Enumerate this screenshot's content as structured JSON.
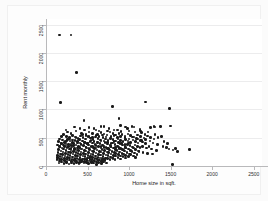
{
  "figure": {
    "background_color": "#fbfbfb",
    "plot_background_color": "#ffffff",
    "marker_color": "#1a1a1a",
    "gridline_color": "#ececed",
    "axis_color": "#b9b9bb"
  },
  "chart_data": {
    "type": "scatter",
    "title": "",
    "xlabel": "Home size in sqft.",
    "ylabel": "Rent monthly",
    "xlim": [
      0,
      2600
    ],
    "ylim": [
      0,
      2600
    ],
    "xticks": [
      0,
      500,
      1000,
      1500,
      2000,
      2500
    ],
    "xticklabels": [
      "0",
      "500",
      "1000",
      "1500",
      "2000",
      "2500"
    ],
    "yticks": [
      0,
      500,
      1000,
      1500,
      2000,
      2500
    ],
    "yticklabels": [
      "0",
      "500",
      "1000",
      "1500",
      "2000",
      "2500"
    ],
    "grid": "horizontal",
    "legend": null,
    "n_points": 402,
    "points": [
      [
        160,
        2320
      ],
      [
        300,
        2320
      ],
      [
        370,
        1650
      ],
      [
        175,
        1120
      ],
      [
        800,
        1050
      ],
      [
        1200,
        1130
      ],
      [
        1490,
        1020
      ],
      [
        1520,
        30
      ],
      [
        455,
        800
      ],
      [
        880,
        845
      ],
      [
        1380,
        700
      ],
      [
        1500,
        705
      ],
      [
        700,
        700
      ],
      [
        760,
        660
      ],
      [
        960,
        690
      ],
      [
        1035,
        700
      ],
      [
        1130,
        650
      ],
      [
        1255,
        680
      ],
      [
        1300,
        700
      ],
      [
        1310,
        690
      ],
      [
        600,
        640
      ],
      [
        640,
        620
      ],
      [
        860,
        640
      ],
      [
        905,
        610
      ],
      [
        1000,
        620
      ],
      [
        1070,
        600
      ],
      [
        1150,
        590
      ],
      [
        1190,
        560
      ],
      [
        430,
        580
      ],
      [
        480,
        560
      ],
      [
        520,
        600
      ],
      [
        560,
        575
      ],
      [
        620,
        555
      ],
      [
        660,
        590
      ],
      [
        700,
        565
      ],
      [
        735,
        545
      ],
      [
        770,
        600
      ],
      [
        805,
        570
      ],
      [
        840,
        545
      ],
      [
        880,
        580
      ],
      [
        915,
        555
      ],
      [
        950,
        530
      ],
      [
        985,
        565
      ],
      [
        1020,
        540
      ],
      [
        1060,
        510
      ],
      [
        1100,
        545
      ],
      [
        1140,
        520
      ],
      [
        1180,
        495
      ],
      [
        1220,
        530
      ],
      [
        1260,
        505
      ],
      [
        1300,
        480
      ],
      [
        1350,
        500
      ],
      [
        1420,
        430
      ],
      [
        1460,
        400
      ],
      [
        1560,
        310
      ],
      [
        1730,
        290
      ],
      [
        250,
        520
      ],
      [
        285,
        500
      ],
      [
        320,
        540
      ],
      [
        350,
        515
      ],
      [
        385,
        490
      ],
      [
        415,
        530
      ],
      [
        445,
        505
      ],
      [
        475,
        480
      ],
      [
        505,
        520
      ],
      [
        535,
        495
      ],
      [
        565,
        470
      ],
      [
        595,
        510
      ],
      [
        625,
        485
      ],
      [
        655,
        460
      ],
      [
        685,
        500
      ],
      [
        715,
        475
      ],
      [
        745,
        450
      ],
      [
        775,
        490
      ],
      [
        805,
        465
      ],
      [
        835,
        440
      ],
      [
        865,
        480
      ],
      [
        895,
        455
      ],
      [
        925,
        430
      ],
      [
        955,
        470
      ],
      [
        985,
        445
      ],
      [
        1015,
        420
      ],
      [
        1045,
        460
      ],
      [
        1075,
        435
      ],
      [
        1105,
        410
      ],
      [
        1135,
        450
      ],
      [
        1165,
        425
      ],
      [
        1195,
        400
      ],
      [
        200,
        460
      ],
      [
        230,
        435
      ],
      [
        260,
        470
      ],
      [
        290,
        445
      ],
      [
        320,
        420
      ],
      [
        350,
        455
      ],
      [
        380,
        430
      ],
      [
        410,
        405
      ],
      [
        440,
        445
      ],
      [
        470,
        420
      ],
      [
        500,
        395
      ],
      [
        530,
        435
      ],
      [
        560,
        410
      ],
      [
        590,
        385
      ],
      [
        620,
        425
      ],
      [
        650,
        400
      ],
      [
        680,
        375
      ],
      [
        710,
        415
      ],
      [
        740,
        390
      ],
      [
        770,
        365
      ],
      [
        800,
        405
      ],
      [
        830,
        380
      ],
      [
        860,
        355
      ],
      [
        890,
        395
      ],
      [
        920,
        370
      ],
      [
        950,
        345
      ],
      [
        980,
        385
      ],
      [
        1010,
        360
      ],
      [
        1040,
        335
      ],
      [
        1070,
        375
      ],
      [
        1100,
        350
      ],
      [
        1130,
        325
      ],
      [
        180,
        400
      ],
      [
        210,
        375
      ],
      [
        240,
        410
      ],
      [
        270,
        385
      ],
      [
        300,
        360
      ],
      [
        330,
        395
      ],
      [
        360,
        370
      ],
      [
        390,
        345
      ],
      [
        420,
        385
      ],
      [
        450,
        360
      ],
      [
        480,
        335
      ],
      [
        510,
        375
      ],
      [
        540,
        350
      ],
      [
        570,
        325
      ],
      [
        600,
        365
      ],
      [
        630,
        340
      ],
      [
        660,
        315
      ],
      [
        690,
        355
      ],
      [
        720,
        330
      ],
      [
        750,
        305
      ],
      [
        780,
        345
      ],
      [
        810,
        320
      ],
      [
        840,
        295
      ],
      [
        870,
        335
      ],
      [
        900,
        310
      ],
      [
        930,
        285
      ],
      [
        960,
        325
      ],
      [
        990,
        300
      ],
      [
        1020,
        275
      ],
      [
        1050,
        315
      ],
      [
        1080,
        290
      ],
      [
        1110,
        265
      ],
      [
        165,
        340
      ],
      [
        195,
        315
      ],
      [
        225,
        350
      ],
      [
        255,
        325
      ],
      [
        285,
        300
      ],
      [
        315,
        335
      ],
      [
        345,
        310
      ],
      [
        375,
        285
      ],
      [
        405,
        325
      ],
      [
        435,
        300
      ],
      [
        465,
        275
      ],
      [
        495,
        315
      ],
      [
        525,
        290
      ],
      [
        555,
        265
      ],
      [
        585,
        305
      ],
      [
        615,
        280
      ],
      [
        645,
        255
      ],
      [
        675,
        295
      ],
      [
        705,
        270
      ],
      [
        735,
        245
      ],
      [
        765,
        285
      ],
      [
        795,
        260
      ],
      [
        825,
        235
      ],
      [
        855,
        275
      ],
      [
        885,
        250
      ],
      [
        915,
        225
      ],
      [
        945,
        265
      ],
      [
        975,
        240
      ],
      [
        1005,
        215
      ],
      [
        1035,
        255
      ],
      [
        1065,
        230
      ],
      [
        1095,
        205
      ],
      [
        150,
        290
      ],
      [
        180,
        265
      ],
      [
        210,
        300
      ],
      [
        240,
        275
      ],
      [
        270,
        250
      ],
      [
        300,
        285
      ],
      [
        330,
        260
      ],
      [
        360,
        235
      ],
      [
        390,
        275
      ],
      [
        420,
        250
      ],
      [
        450,
        225
      ],
      [
        480,
        265
      ],
      [
        510,
        240
      ],
      [
        540,
        215
      ],
      [
        570,
        255
      ],
      [
        600,
        230
      ],
      [
        630,
        205
      ],
      [
        660,
        245
      ],
      [
        690,
        220
      ],
      [
        720,
        195
      ],
      [
        750,
        235
      ],
      [
        780,
        210
      ],
      [
        810,
        185
      ],
      [
        840,
        225
      ],
      [
        870,
        200
      ],
      [
        900,
        175
      ],
      [
        930,
        215
      ],
      [
        960,
        190
      ],
      [
        990,
        165
      ],
      [
        1020,
        205
      ],
      [
        1050,
        180
      ],
      [
        1080,
        155
      ],
      [
        145,
        240
      ],
      [
        175,
        215
      ],
      [
        205,
        250
      ],
      [
        235,
        225
      ],
      [
        265,
        200
      ],
      [
        295,
        235
      ],
      [
        325,
        210
      ],
      [
        355,
        185
      ],
      [
        385,
        225
      ],
      [
        415,
        200
      ],
      [
        445,
        175
      ],
      [
        475,
        215
      ],
      [
        505,
        190
      ],
      [
        535,
        165
      ],
      [
        565,
        205
      ],
      [
        595,
        180
      ],
      [
        625,
        155
      ],
      [
        655,
        195
      ],
      [
        685,
        170
      ],
      [
        715,
        145
      ],
      [
        745,
        185
      ],
      [
        775,
        160
      ],
      [
        805,
        135
      ],
      [
        835,
        175
      ],
      [
        865,
        150
      ],
      [
        895,
        125
      ],
      [
        925,
        165
      ],
      [
        955,
        140
      ],
      [
        140,
        190
      ],
      [
        170,
        165
      ],
      [
        200,
        200
      ],
      [
        230,
        175
      ],
      [
        260,
        150
      ],
      [
        290,
        185
      ],
      [
        320,
        160
      ],
      [
        350,
        135
      ],
      [
        380,
        175
      ],
      [
        410,
        150
      ],
      [
        440,
        125
      ],
      [
        470,
        165
      ],
      [
        500,
        140
      ],
      [
        530,
        115
      ],
      [
        560,
        155
      ],
      [
        590,
        130
      ],
      [
        620,
        105
      ],
      [
        650,
        145
      ],
      [
        680,
        120
      ],
      [
        710,
        95
      ],
      [
        740,
        135
      ],
      [
        770,
        110
      ],
      [
        800,
        140
      ],
      [
        830,
        115
      ],
      [
        135,
        150
      ],
      [
        165,
        125
      ],
      [
        195,
        160
      ],
      [
        225,
        135
      ],
      [
        255,
        110
      ],
      [
        285,
        145
      ],
      [
        315,
        120
      ],
      [
        345,
        95
      ],
      [
        375,
        135
      ],
      [
        405,
        110
      ],
      [
        435,
        85
      ],
      [
        465,
        125
      ],
      [
        495,
        100
      ],
      [
        525,
        140
      ],
      [
        555,
        115
      ],
      [
        585,
        90
      ],
      [
        615,
        130
      ],
      [
        645,
        105
      ],
      [
        675,
        145
      ],
      [
        705,
        120
      ],
      [
        130,
        110
      ],
      [
        160,
        85
      ],
      [
        190,
        120
      ],
      [
        220,
        95
      ],
      [
        250,
        70
      ],
      [
        280,
        105
      ],
      [
        310,
        80
      ],
      [
        340,
        115
      ],
      [
        370,
        90
      ],
      [
        400,
        65
      ],
      [
        430,
        100
      ],
      [
        460,
        75
      ],
      [
        490,
        110
      ],
      [
        520,
        85
      ],
      [
        550,
        60
      ],
      [
        580,
        95
      ],
      [
        610,
        70
      ],
      [
        640,
        105
      ],
      [
        670,
        80
      ],
      [
        700,
        115
      ],
      [
        155,
        55
      ],
      [
        185,
        70
      ],
      [
        215,
        45
      ],
      [
        245,
        60
      ],
      [
        275,
        35
      ],
      [
        305,
        55
      ],
      [
        335,
        40
      ],
      [
        365,
        60
      ],
      [
        395,
        45
      ],
      [
        425,
        70
      ],
      [
        455,
        50
      ],
      [
        485,
        65
      ],
      [
        515,
        40
      ],
      [
        545,
        75
      ],
      [
        575,
        50
      ],
      [
        605,
        30
      ],
      [
        635,
        65
      ],
      [
        665,
        45
      ],
      [
        695,
        70
      ],
      [
        725,
        50
      ],
      [
        360,
        620
      ],
      [
        410,
        660
      ],
      [
        340,
        690
      ],
      [
        460,
        640
      ],
      [
        520,
        680
      ],
      [
        580,
        660
      ],
      [
        660,
        700
      ],
      [
        740,
        620
      ],
      [
        820,
        640
      ],
      [
        900,
        720
      ],
      [
        980,
        660
      ],
      [
        1060,
        690
      ],
      [
        1140,
        620
      ],
      [
        1230,
        600
      ],
      [
        1310,
        560
      ],
      [
        1390,
        520
      ],
      [
        260,
        600
      ],
      [
        300,
        575
      ],
      [
        210,
        555
      ],
      [
        240,
        640
      ],
      [
        190,
        520
      ],
      [
        165,
        480
      ],
      [
        150,
        430
      ],
      [
        140,
        370
      ],
      [
        1250,
        440
      ],
      [
        1290,
        410
      ],
      [
        1340,
        380
      ],
      [
        1410,
        350
      ],
      [
        1450,
        330
      ],
      [
        1480,
        300
      ],
      [
        1530,
        280
      ],
      [
        1580,
        260
      ],
      [
        1100,
        480
      ],
      [
        1150,
        455
      ],
      [
        1200,
        470
      ],
      [
        1240,
        350
      ],
      [
        950,
        500
      ],
      [
        1000,
        480
      ],
      [
        1040,
        510
      ],
      [
        1090,
        490
      ],
      [
        780,
        520
      ],
      [
        820,
        540
      ],
      [
        860,
        500
      ],
      [
        900,
        520
      ],
      [
        600,
        540
      ],
      [
        640,
        520
      ],
      [
        680,
        545
      ],
      [
        720,
        515
      ],
      [
        440,
        560
      ],
      [
        480,
        540
      ],
      [
        520,
        520
      ],
      [
        560,
        500
      ],
      [
        280,
        480
      ],
      [
        320,
        460
      ],
      [
        360,
        500
      ],
      [
        400,
        470
      ],
      [
        220,
        420
      ],
      [
        250,
        440
      ],
      [
        190,
        395
      ],
      [
        170,
        345
      ],
      [
        1160,
        340
      ],
      [
        1210,
        320
      ],
      [
        1270,
        300
      ],
      [
        1330,
        270
      ],
      [
        870,
        420
      ],
      [
        910,
        400
      ],
      [
        950,
        380
      ],
      [
        990,
        410
      ],
      [
        700,
        440
      ],
      [
        740,
        420
      ],
      [
        780,
        400
      ],
      [
        820,
        430
      ],
      [
        540,
        450
      ],
      [
        580,
        430
      ],
      [
        620,
        410
      ],
      [
        660,
        440
      ],
      [
        380,
        410
      ],
      [
        420,
        390
      ],
      [
        460,
        420
      ],
      [
        500,
        400
      ],
      [
        240,
        370
      ],
      [
        270,
        350
      ],
      [
        300,
        390
      ],
      [
        330,
        360
      ],
      [
        1120,
        260
      ],
      [
        1170,
        240
      ],
      [
        1220,
        225
      ],
      [
        1280,
        210
      ],
      [
        840,
        330
      ],
      [
        880,
        310
      ],
      [
        920,
        290
      ],
      [
        960,
        320
      ],
      [
        660,
        350
      ],
      [
        700,
        330
      ],
      [
        740,
        310
      ],
      [
        780,
        340
      ],
      [
        480,
        330
      ],
      [
        520,
        310
      ],
      [
        560,
        340
      ],
      [
        600,
        320
      ],
      [
        300,
        310
      ],
      [
        340,
        290
      ],
      [
        380,
        320
      ],
      [
        420,
        300
      ]
    ]
  }
}
